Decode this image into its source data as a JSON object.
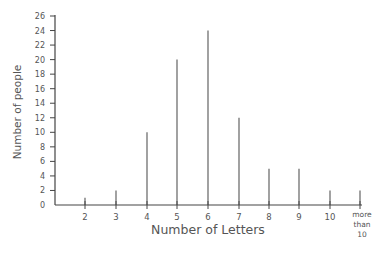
{
  "chart_data": {
    "type": "bar",
    "style": "line-stick (vertical line graph)",
    "title": "",
    "xlabel": "Number of Letters",
    "ylabel": "Number of people",
    "categories": [
      "2",
      "3",
      "4",
      "5",
      "6",
      "7",
      "8",
      "9",
      "10",
      "more than 10"
    ],
    "values": [
      1,
      2,
      10,
      20,
      24,
      12,
      5,
      5,
      2,
      2
    ],
    "ylim": [
      0,
      26
    ],
    "yticks": [
      0,
      2,
      4,
      6,
      8,
      10,
      12,
      14,
      16,
      18,
      20,
      22,
      24,
      26
    ],
    "grid": false,
    "legend": null
  },
  "labels": {
    "xlabel": "Number of Letters",
    "ylabel": "Number of people",
    "last_category_lines": [
      "more",
      "than",
      "10"
    ]
  },
  "colors": {
    "axis": "#444444",
    "bars": "#555555",
    "text": "#555555"
  }
}
